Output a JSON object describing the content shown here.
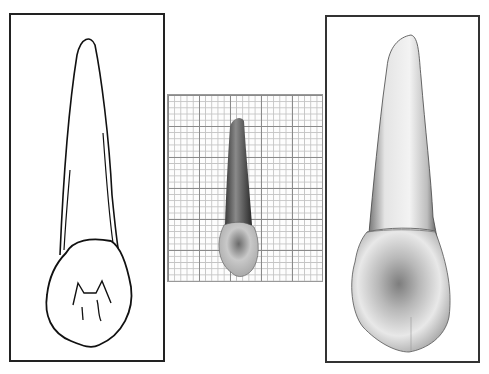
{
  "figure": {
    "panels": [
      {
        "id": "left",
        "kind": "line-drawing",
        "subject": "tooth outline with occlusal view"
      },
      {
        "id": "middle",
        "kind": "photo-on-grid",
        "subject": "tooth photograph on millimeter grid paper"
      },
      {
        "id": "right",
        "kind": "photo",
        "subject": "enlarged tooth photograph"
      }
    ],
    "colors": {
      "line": "#111111",
      "grid_major": "#8a8a8a",
      "grid_minor": "#c4c4c4",
      "tooth_light": "#e6e6e6",
      "tooth_dark": "#6e6e6e"
    }
  }
}
